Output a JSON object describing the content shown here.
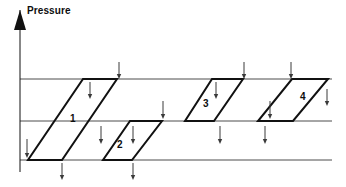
{
  "figure": {
    "title": "",
    "axis": {
      "y_label": "Pressure",
      "y_label_x": 27,
      "y_label_y": 5,
      "axis_x": 20,
      "axis_top_y": 10,
      "axis_bottom_y": 172,
      "arrow_head_half_width": 6,
      "arrow_head_height": 20,
      "color": "#111111"
    },
    "grid": {
      "color": "#4d4d4d",
      "stroke_width": 1,
      "x_start": 20,
      "x_end": 332,
      "lines": [
        {
          "name": "upper-boundary-line",
          "y": 79
        },
        {
          "name": "middle-boundary-line",
          "y": 121
        },
        {
          "name": "lower-boundary-line",
          "y": 160
        }
      ]
    },
    "cells": [
      {
        "label": "1",
        "label_x": 70,
        "label_y": 113,
        "stroke": "#111111",
        "stroke_width": 2,
        "points": "28,160 62,160 117,79 83,79"
      },
      {
        "label": "2",
        "label_x": 117,
        "label_y": 139,
        "stroke": "#111111",
        "stroke_width": 2,
        "points": "103,160 132,160 162,121 130,121"
      },
      {
        "label": "3",
        "label_x": 203,
        "label_y": 98,
        "stroke": "#111111",
        "stroke_width": 2,
        "points": "185,121 214,121 243,79 212,79"
      },
      {
        "label": "4",
        "label_x": 300,
        "label_y": 91,
        "stroke": "#111111",
        "stroke_width": 2,
        "points": "258,121 293,121 328,79 292,79"
      }
    ],
    "arrows": {
      "color": "#3a3a3a",
      "stroke_width": 1,
      "head_half_width": 2.2,
      "head_height": 5,
      "items": [
        {
          "name": "arrow-above-top-1",
          "x": 119,
          "y1": 62,
          "y2": 79
        },
        {
          "name": "arrow-above-top-2",
          "x": 244,
          "y1": 62,
          "y2": 79
        },
        {
          "name": "arrow-above-top-3",
          "x": 291,
          "y1": 62,
          "y2": 79
        },
        {
          "name": "arrow-upper-band-1",
          "x": 90,
          "y1": 82,
          "y2": 99
        },
        {
          "name": "arrow-upper-band-2",
          "x": 163,
          "y1": 101,
          "y2": 119
        },
        {
          "name": "arrow-upper-band-3",
          "x": 216,
          "y1": 82,
          "y2": 99
        },
        {
          "name": "arrow-upper-band-4",
          "x": 270,
          "y1": 101,
          "y2": 119
        },
        {
          "name": "arrow-upper-band-5",
          "x": 327,
          "y1": 89,
          "y2": 106
        },
        {
          "name": "arrow-lower-band-1",
          "x": 27,
          "y1": 139,
          "y2": 158
        },
        {
          "name": "arrow-lower-band-2",
          "x": 101,
          "y1": 126,
          "y2": 144
        },
        {
          "name": "arrow-lower-band-3",
          "x": 133,
          "y1": 126,
          "y2": 144
        },
        {
          "name": "arrow-lower-band-4",
          "x": 220,
          "y1": 126,
          "y2": 144
        },
        {
          "name": "arrow-lower-band-5",
          "x": 265,
          "y1": 126,
          "y2": 144
        },
        {
          "name": "arrow-below-bottom-1",
          "x": 62,
          "y1": 163,
          "y2": 180
        },
        {
          "name": "arrow-below-bottom-2",
          "x": 133,
          "y1": 163,
          "y2": 180
        }
      ]
    }
  },
  "chart_data": {
    "type": "diagram",
    "title": "",
    "xlabel": "",
    "ylabel": "Pressure",
    "grid": true,
    "legend": "none",
    "boundary_levels": [
      79,
      121,
      160
    ],
    "series": [
      {
        "name": "cells",
        "values": [
          1,
          2,
          3,
          4
        ],
        "labels": [
          "1",
          "2",
          "3",
          "4"
        ],
        "band": [
          "upper+lower",
          "lower",
          "upper",
          "upper"
        ]
      }
    ]
  }
}
